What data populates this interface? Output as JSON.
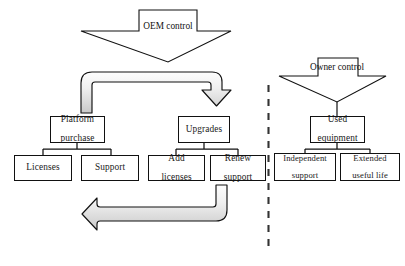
{
  "diagram": {
    "type": "flow-diagram",
    "colors": {
      "stroke": "#111111",
      "box_fill": "#ffffff",
      "background": "#ffffff",
      "band_arrow_fill_light": "#f2f2f2",
      "band_arrow_fill_mid": "#d9d9d9",
      "divider": "#333333"
    },
    "divider": {
      "name": "control-boundary",
      "style": "dashed-vertical"
    },
    "banner_arrows": [
      {
        "id": "oem-control",
        "label_line1": "OEM",
        "label_line2": "control",
        "direction": "down"
      },
      {
        "id": "owner-control",
        "label_line1": "Owner",
        "label_line2": "control",
        "direction": "down"
      }
    ],
    "groups": [
      {
        "id": "platform-purchase",
        "parent": {
          "line1": "Platform",
          "line2": "purchase"
        },
        "children": [
          {
            "id": "licenses",
            "line1": "Licenses",
            "line2": ""
          },
          {
            "id": "support",
            "line1": "Support",
            "line2": ""
          }
        ]
      },
      {
        "id": "upgrades",
        "parent": {
          "line1": "Upgrades",
          "line2": ""
        },
        "children": [
          {
            "id": "add-licenses",
            "line1": "Add",
            "line2": "licenses"
          },
          {
            "id": "renew-support",
            "line1": "Renew",
            "line2": "support"
          }
        ]
      },
      {
        "id": "used-equipment",
        "parent": {
          "line1": "Used",
          "line2": "equipment"
        },
        "children": [
          {
            "id": "independent-support",
            "line1": "Independent",
            "line2": "support"
          },
          {
            "id": "extended-useful-life",
            "line1": "Extended",
            "line2": "useful life"
          }
        ]
      }
    ],
    "cycle_arrows": [
      {
        "id": "top-cycle-arrow",
        "from": "platform-purchase",
        "to": "upgrades",
        "direction": "right-then-down"
      },
      {
        "id": "bottom-cycle-arrow",
        "from": "renew-support",
        "to": "platform-purchase",
        "direction": "left-then-up"
      }
    ]
  }
}
